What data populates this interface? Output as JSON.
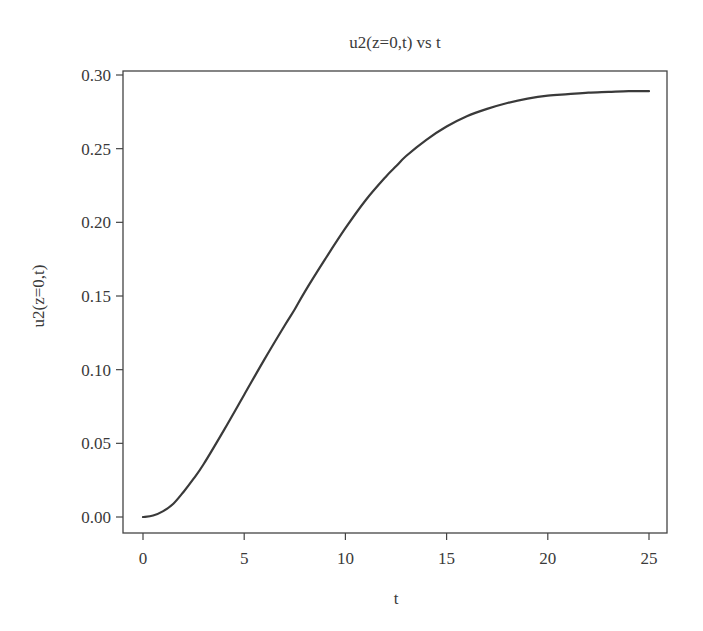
{
  "chart_data": {
    "type": "line",
    "title": "u2(z=0,t) vs t",
    "xlabel": "t",
    "ylabel": "u2(z=0,t)",
    "xlim": [
      -0.9,
      25.9
    ],
    "ylim": [
      -0.011,
      0.301
    ],
    "xticks": [
      0,
      5,
      10,
      15,
      20,
      25
    ],
    "xtick_labels": [
      "0",
      "5",
      "10",
      "15",
      "20",
      "25"
    ],
    "yticks": [
      0.0,
      0.05,
      0.1,
      0.15,
      0.2,
      0.25,
      0.3
    ],
    "ytick_labels": [
      "0.00",
      "0.05",
      "0.10",
      "0.15",
      "0.20",
      "0.25",
      "0.30"
    ],
    "grid": false,
    "legend": null,
    "line_color": "#3a3a3a",
    "series": [
      {
        "name": "u2(z=0,t)",
        "x": [
          0,
          0.5,
          1,
          1.5,
          2,
          2.5,
          3,
          4,
          5,
          6,
          7,
          7.5,
          8,
          9,
          10,
          11,
          12,
          12.5,
          13,
          14,
          15,
          16,
          17,
          18,
          19,
          20,
          21,
          22,
          23,
          24,
          25
        ],
        "y": [
          0.0,
          0.001,
          0.004,
          0.009,
          0.017,
          0.026,
          0.036,
          0.059,
          0.083,
          0.107,
          0.13,
          0.141,
          0.153,
          0.175,
          0.196,
          0.215,
          0.231,
          0.238,
          0.245,
          0.256,
          0.265,
          0.272,
          0.277,
          0.281,
          0.284,
          0.286,
          0.287,
          0.288,
          0.2885,
          0.289,
          0.289
        ]
      }
    ]
  }
}
